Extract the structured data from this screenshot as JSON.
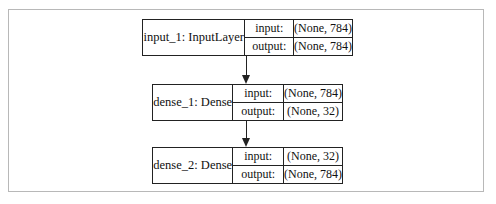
{
  "diagram": {
    "type": "keras-model-plot",
    "nodes": [
      {
        "name": "input_1: InputLayer",
        "input_label": "input:",
        "input_shape": "(None, 784)",
        "output_label": "output:",
        "output_shape": "(None, 784)"
      },
      {
        "name": "dense_1: Dense",
        "input_label": "input:",
        "input_shape": "(None, 784)",
        "output_label": "output:",
        "output_shape": "(None, 32)"
      },
      {
        "name": "dense_2: Dense",
        "input_label": "input:",
        "input_shape": "(None, 32)",
        "output_label": "output:",
        "output_shape": "(None, 784)"
      }
    ],
    "edges": [
      {
        "from": "input_1",
        "to": "dense_1"
      },
      {
        "from": "dense_1",
        "to": "dense_2"
      }
    ]
  }
}
